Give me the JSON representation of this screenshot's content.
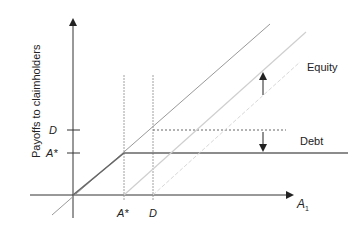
{
  "diagram": {
    "y_axis_label": "Payoffs to claimholders",
    "x_axis_label": "A",
    "x_axis_subscript": "1",
    "y_ticks": [
      {
        "label": "D"
      },
      {
        "label": "A*"
      }
    ],
    "x_ticks": [
      {
        "label": "A*"
      },
      {
        "label": "D"
      }
    ],
    "curves": {
      "equity_label": "Equity",
      "debt_label": "Debt"
    },
    "colors": {
      "axis": "#222222",
      "main_line": "#888888",
      "light_line": "#cccccc",
      "debt_line": "#666666",
      "dashed": "#999999"
    }
  }
}
